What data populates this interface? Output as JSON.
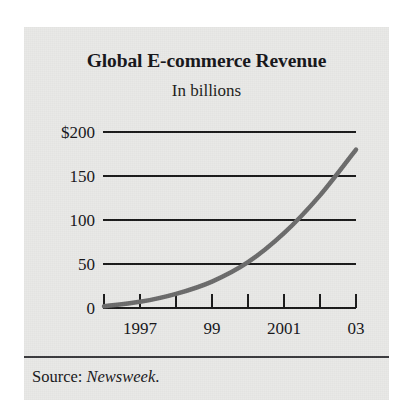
{
  "figure": {
    "title": "Global E-commerce Revenue",
    "subtitle": "In billions",
    "source_prefix": "Source: ",
    "source_name": "Newsweek",
    "source_suffix": ".",
    "panel_bg": "#e9e9e7",
    "line_color": "#6b6b6b",
    "axis_color": "#1a1a1a"
  },
  "chart_data": {
    "type": "line",
    "title": "Global E-commerce Revenue",
    "subtitle": "In billions",
    "xlabel": "",
    "ylabel": "",
    "yunit": "billions of dollars",
    "ylim": [
      0,
      200
    ],
    "xlim": [
      1996,
      2003
    ],
    "grid": true,
    "gridlines_y": [
      50,
      100,
      150,
      200
    ],
    "legend": "none",
    "x": [
      1996,
      1997,
      1998,
      1999,
      2000,
      2001,
      2002,
      2003
    ],
    "x_tick_labels": [
      "",
      "1997",
      "",
      "99",
      "",
      "2001",
      "",
      "03"
    ],
    "y_tick_labels": [
      "0",
      "50",
      "100",
      "150",
      "$200"
    ],
    "y_tick_values": [
      0,
      50,
      100,
      150,
      200
    ],
    "series": [
      {
        "name": "Global E-commerce Revenue",
        "values": [
          2,
          7,
          16,
          30,
          52,
          85,
          128,
          180
        ]
      }
    ],
    "annotations": []
  }
}
